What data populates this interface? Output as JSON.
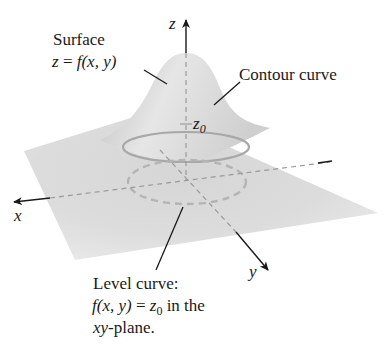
{
  "figure": {
    "type": "3d-surface-level-curve-diagram",
    "colors": {
      "surface": "#c8c8c8",
      "surface_light": "#ececec",
      "axis": "#1a1a1a",
      "dashed": "#9a9a9a",
      "background": "#ffffff"
    }
  },
  "axes": {
    "z_label": "z",
    "x_label": "x",
    "y_label": "y"
  },
  "labels": {
    "surface": {
      "line1": "Surface",
      "line2_z": "z",
      "line2_eq": " = ",
      "line2_f": "f",
      "line2_args": "(x, y)"
    },
    "contour": {
      "text": "Contour curve"
    },
    "z0": {
      "base": "z",
      "sub": "0"
    },
    "level": {
      "line1": "Level curve:",
      "line2_f": "f",
      "line2_args": "(x, y)",
      "line2_eq": " = ",
      "line2_z": "z",
      "line2_sub": "0",
      "line2_tail": " in the",
      "line3_xy": "xy",
      "line3_tail": "-plane."
    }
  }
}
